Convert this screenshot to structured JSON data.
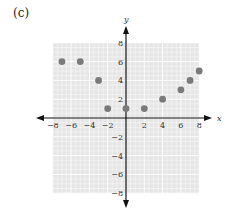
{
  "panel_label": "(c)",
  "colors": {
    "grid_background": "#e6e6e6",
    "grid_lines": "#ffffff",
    "axis": "#111111",
    "points": "#7a7a7a"
  },
  "chart_data": {
    "type": "scatter",
    "title": "",
    "xlabel": "x",
    "ylabel": "y",
    "xlim": [
      -8,
      8
    ],
    "ylim": [
      -8,
      8
    ],
    "grid": true,
    "x_ticks": [
      -8,
      -6,
      -4,
      -2,
      2,
      4,
      6,
      8
    ],
    "y_ticks": [
      8,
      6,
      4,
      2,
      -2,
      -4,
      -6,
      -8
    ],
    "x_tick_labels": [
      "−8",
      "−6",
      "−4",
      "−2",
      "2",
      "4",
      "6",
      "8"
    ],
    "y_tick_labels": [
      "8",
      "6",
      "4",
      "2",
      "−2",
      "−4",
      "−6",
      "−8"
    ],
    "series": [
      {
        "name": "points",
        "points": [
          {
            "x": -7,
            "y": 6
          },
          {
            "x": -5,
            "y": 6
          },
          {
            "x": -3,
            "y": 4
          },
          {
            "x": -2,
            "y": 1
          },
          {
            "x": 0,
            "y": 1
          },
          {
            "x": 2,
            "y": 1
          },
          {
            "x": 4,
            "y": 2
          },
          {
            "x": 6,
            "y": 3
          },
          {
            "x": 7,
            "y": 4
          },
          {
            "x": 8,
            "y": 5
          }
        ]
      }
    ]
  }
}
